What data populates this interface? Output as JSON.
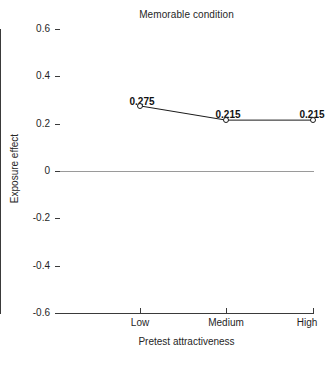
{
  "chart_data": {
    "type": "line",
    "title": "Memorable condition",
    "xlabel": "Pretest attractiveness",
    "ylabel": "Exposure effect",
    "categories": [
      "Low",
      "Medium",
      "High"
    ],
    "values": [
      0.275,
      0.215,
      0.215
    ],
    "point_labels": [
      "0.275",
      "0.215",
      "0.215"
    ],
    "ylim": [
      -0.6,
      0.6
    ],
    "ytick_labels": [
      "0.6",
      "0.4",
      "0.2",
      "0",
      "-0.2",
      "-0.4",
      "-0.6"
    ],
    "ytick_values": [
      0.6,
      0.4,
      0.2,
      0,
      -0.2,
      -0.4,
      -0.6
    ],
    "grid": false,
    "legend": "none",
    "zero_reference_line": true,
    "marker": "open-circle",
    "series": [
      {
        "name": "Memorable condition",
        "values": [
          0.275,
          0.215,
          0.215
        ]
      }
    ],
    "colors": {
      "line": "#1a1a1a",
      "marker_fill": "#ffffff",
      "marker_stroke": "#1a1a1a",
      "axis": "#3a3a3a",
      "zero_line": "#9a9a9a",
      "text": "#1f1f1f",
      "background": "#ffffff"
    }
  },
  "artifact": {
    "bottom_smudge": "                  "
  }
}
